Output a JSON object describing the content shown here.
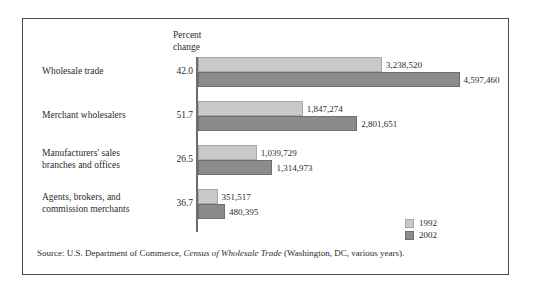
{
  "figure": {
    "axis_heading_line1": "Percent",
    "axis_heading_line2": "change",
    "source_prefix": "Source: U.S. Department of Commerce, ",
    "source_italic": "Census of Wholesale Trade",
    "source_suffix": " (Washington, DC, various years)."
  },
  "legend": {
    "position": "bottom-right",
    "items": [
      {
        "label": "1992",
        "color": "#c9c9c9"
      },
      {
        "label": "2002",
        "color": "#8b8b8b"
      }
    ]
  },
  "colors": {
    "series_1992": "#c9c9c9",
    "series_2002": "#8b8b8b",
    "frame": "#4a4a4a",
    "axis": "#6e6e6e",
    "text": "#2b2b2b"
  },
  "chart_data": {
    "type": "bar",
    "orientation": "horizontal",
    "title": "",
    "subtitle": "",
    "xlabel": "",
    "ylabel": "",
    "grid": false,
    "legend_position": "bottom-right",
    "xlim": [
      0,
      4597460
    ],
    "categories": [
      "Wholesale trade",
      "Merchant wholesalers",
      "Manufacturers' sales branches and offices",
      "Agents, brokers, and commission merchants"
    ],
    "category_label_lines": [
      [
        "Wholesale trade"
      ],
      [
        "Merchant wholesalers"
      ],
      [
        "Manufacturers' sales",
        "branches and offices"
      ],
      [
        "Agents, brokers, and",
        "commission merchants"
      ]
    ],
    "series": [
      {
        "name": "1992",
        "color": "#c9c9c9",
        "values": [
          3238520,
          1847274,
          1039729,
          351517
        ],
        "value_labels": [
          "3,238,520",
          "1,847,274",
          "1,039,729",
          "351,517"
        ]
      },
      {
        "name": "2002",
        "color": "#8b8b8b",
        "values": [
          4597460,
          2801651,
          1314973,
          480395
        ],
        "value_labels": [
          "4,597,460",
          "2,801,651",
          "1,314,973",
          "480,395"
        ]
      }
    ],
    "annotations": {
      "axis_heading": "Percent change",
      "percent_change_labels": [
        "42.0",
        "51.7",
        "26.5",
        "36.7"
      ],
      "percent_change_values": [
        42.0,
        51.7,
        26.5,
        36.7
      ]
    }
  }
}
